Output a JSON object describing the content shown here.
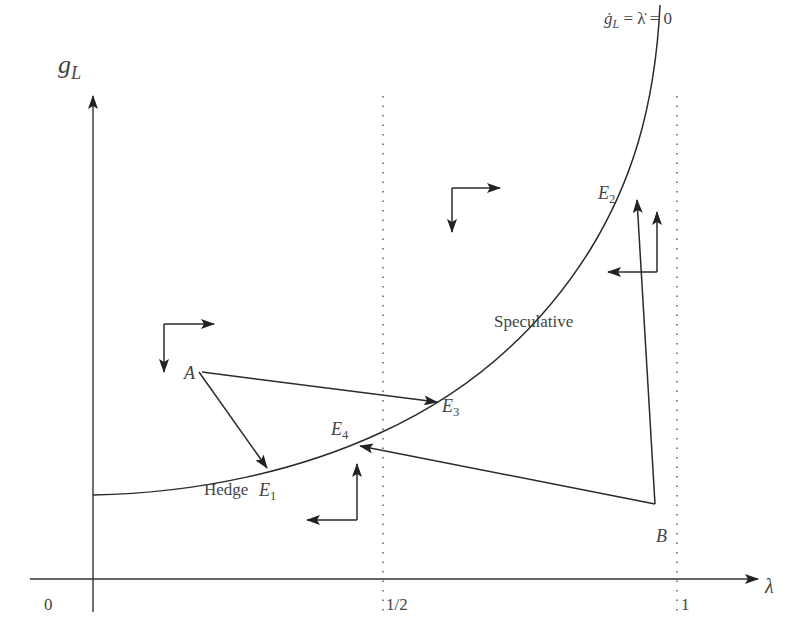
{
  "diagram": {
    "type": "phase-diagram",
    "axes": {
      "y_label": "g",
      "y_label_sub": "L",
      "x_label": "λ",
      "origin_label": "0",
      "x_ticks": [
        {
          "label": "1/2",
          "x": 383
        },
        {
          "label": "1",
          "x": 678
        }
      ]
    },
    "curve": {
      "label_prefix": "ġ",
      "label_sub": "L",
      "label_rest": " = λ̇ = 0",
      "description": "locus where g_L-dot = lambda-dot = 0"
    },
    "regions": {
      "hedge": "Hedge",
      "speculative": "Speculative"
    },
    "points": {
      "A": "A",
      "B": "B",
      "E1": {
        "letter": "E",
        "sub": "1"
      },
      "E2": {
        "letter": "E",
        "sub": "2"
      },
      "E3": {
        "letter": "E",
        "sub": "3"
      },
      "E4": {
        "letter": "E",
        "sub": "4"
      }
    },
    "colors": {
      "line": "#2a2a2a",
      "text": "#444444",
      "background": "#ffffff"
    }
  }
}
